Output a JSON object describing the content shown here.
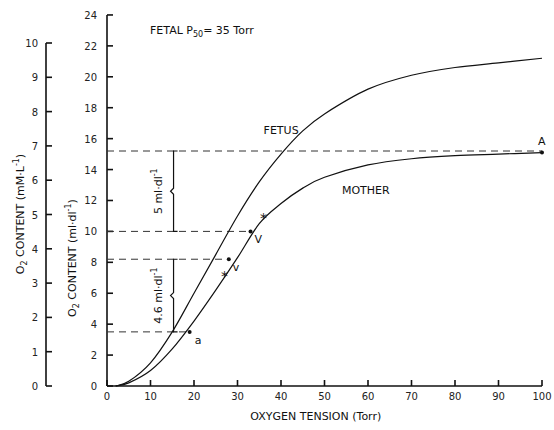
{
  "chart_data": {
    "type": "line",
    "title_parts": {
      "prefix": "FETAL  P",
      "sub": "50",
      "suffix": "= 35 Torr"
    },
    "xlabel": "OXYGEN TENSION (Torr)",
    "ylabel_inner": "O2 CONTENT (ml·dl-1)",
    "ylabel_outer": "O2 CONTENT (mM·L-1)",
    "xlim": [
      0,
      100
    ],
    "ylim_inner": [
      0,
      24
    ],
    "ylim_outer": [
      0,
      10
    ],
    "x_ticks": [
      0,
      10,
      20,
      30,
      40,
      50,
      60,
      70,
      80,
      90,
      100
    ],
    "y_ticks_inner": [
      0,
      2,
      4,
      6,
      8,
      10,
      12,
      14,
      16,
      18,
      20,
      22,
      24
    ],
    "y_ticks_outer": [
      0,
      1,
      2,
      3,
      4,
      5,
      6,
      7,
      8,
      9,
      10
    ],
    "grid": false,
    "series": [
      {
        "name": "FETUS",
        "x": [
          2,
          5,
          10,
          15,
          20,
          25,
          30,
          35,
          40,
          45,
          50,
          60,
          70,
          80,
          90,
          100
        ],
        "y": [
          0,
          0.3,
          1.5,
          3.5,
          6.0,
          8.5,
          11.0,
          13.2,
          15.0,
          16.5,
          17.6,
          19.2,
          20.1,
          20.6,
          20.9,
          21.2
        ]
      },
      {
        "name": "MOTHER",
        "x": [
          2,
          5,
          10,
          15,
          20,
          25,
          30,
          35,
          40,
          45,
          50,
          60,
          70,
          80,
          90,
          100
        ],
        "y": [
          0,
          0.2,
          1.0,
          2.4,
          4.2,
          6.2,
          8.3,
          10.5,
          11.8,
          12.8,
          13.5,
          14.3,
          14.7,
          14.9,
          15.0,
          15.1
        ]
      }
    ],
    "annotations": [
      {
        "text": "A",
        "x": 100,
        "y": 15.1,
        "type": "point"
      },
      {
        "text": "V",
        "x": 33,
        "y": 10.0,
        "type": "point"
      },
      {
        "text": "v",
        "x": 28,
        "y": 8.2,
        "type": "point"
      },
      {
        "text": "a",
        "x": 19,
        "y": 3.5,
        "type": "point"
      },
      {
        "text": "*",
        "x": 36,
        "y": 10.9,
        "type": "marker"
      },
      {
        "text": "*",
        "x": 27,
        "y": 7.2,
        "type": "marker"
      },
      {
        "text": "5 ml·dl-1",
        "from": 10.0,
        "to": 15.2,
        "type": "bracket"
      },
      {
        "text": "4.6 ml·dl-1",
        "from": 3.5,
        "to": 8.2,
        "type": "bracket"
      }
    ],
    "reference_lines": [
      15.2,
      10.0,
      8.2,
      3.5
    ]
  },
  "labels": {
    "fetus": "FETUS",
    "mother": "MOTHER",
    "bracket_upper": "5 ml·dl",
    "bracket_lower": "4.6 ml·dl",
    "sup": "-1",
    "point_A": "A",
    "point_V": "V",
    "point_v": "v",
    "point_a": "a",
    "xlabel": "OXYGEN TENSION (Torr)",
    "ylabel_inner_main": "O",
    "ylabel_inner_sub": "2",
    "ylabel_inner_rest": " CONTENT (ml·dl",
    "ylabel_outer_rest": " CONTENT (mM·L",
    "close": ")"
  }
}
